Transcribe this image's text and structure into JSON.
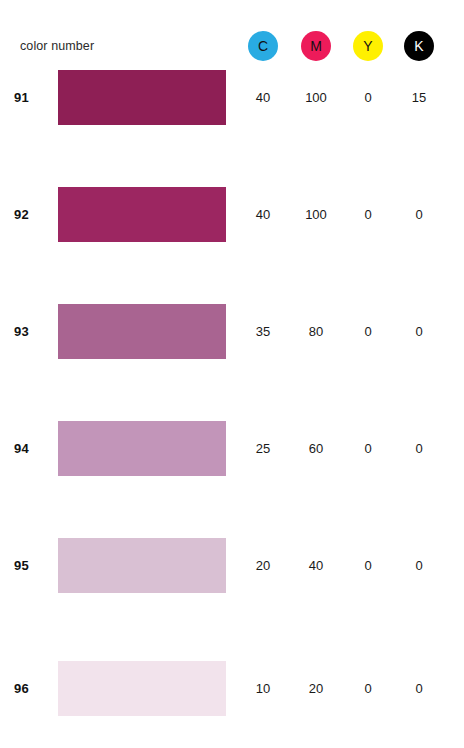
{
  "header": {
    "label": "color number",
    "inks": [
      {
        "name": "cyan",
        "letter": "C",
        "circle_color": "#29ABE2",
        "text_color": "#111111",
        "cx": 263
      },
      {
        "name": "magenta",
        "letter": "M",
        "circle_color": "#ED1B5A",
        "text_color": "#111111",
        "cx": 316
      },
      {
        "name": "yellow",
        "letter": "Y",
        "circle_color": "#FFF000",
        "text_color": "#111111",
        "cx": 368
      },
      {
        "name": "black",
        "letter": "K",
        "circle_color": "#000000",
        "text_color": "#ffffff",
        "cx": 419
      }
    ]
  },
  "chart_data": {
    "type": "table",
    "title": "color number",
    "columns": [
      "color number",
      "swatch",
      "C",
      "M",
      "Y",
      "K"
    ],
    "rows": [
      {
        "number": "91",
        "swatch_color": "#8E1F55",
        "c": "40",
        "m": "100",
        "y": "0",
        "k": "15",
        "top": 70
      },
      {
        "number": "92",
        "swatch_color": "#9C2661",
        "c": "40",
        "m": "100",
        "y": "0",
        "k": "0",
        "top": 187
      },
      {
        "number": "93",
        "swatch_color": "#A96491",
        "c": "35",
        "m": "80",
        "y": "0",
        "k": "0",
        "top": 304
      },
      {
        "number": "94",
        "swatch_color": "#C295B9",
        "c": "25",
        "m": "60",
        "y": "0",
        "k": "0",
        "top": 421
      },
      {
        "number": "95",
        "swatch_color": "#D9C0D3",
        "c": "20",
        "m": "40",
        "y": "0",
        "k": "0",
        "top": 538
      },
      {
        "number": "96",
        "swatch_color": "#F2E3EC",
        "c": "10",
        "m": "20",
        "y": "0",
        "k": "0",
        "top": 661
      }
    ]
  }
}
